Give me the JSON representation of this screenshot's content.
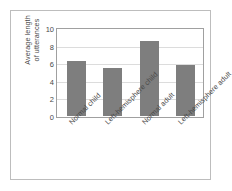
{
  "chart_data": {
    "type": "bar",
    "title": "",
    "xlabel": "",
    "ylabel": "Average length\nof utterances",
    "categories": [
      "Normal child",
      "Left-hemisphere child",
      "Normal adult",
      "Left-hemisphere adult"
    ],
    "values": [
      6.3,
      5.5,
      8.5,
      5.8
    ],
    "ylim": [
      0,
      10
    ],
    "yticks": [
      0,
      2,
      4,
      6,
      8,
      10
    ],
    "ytick_labels": [
      "0",
      "2",
      "4",
      "6",
      "8",
      "10"
    ],
    "grid": true,
    "legend": false,
    "bar_color": "#7e7e7e",
    "axis_color": "#a0a0a0",
    "grid_color": "#dcdcdc",
    "frame_color": "#bdbdbd",
    "background": "#ffffff"
  }
}
